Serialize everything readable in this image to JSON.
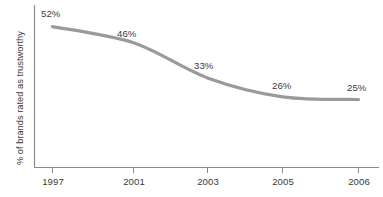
{
  "chart_data": {
    "type": "line",
    "title": "",
    "subtitle": "",
    "xlabel": "",
    "ylabel": "% of brands rated as trustworthy",
    "categories": [
      "1997",
      "2001",
      "2003",
      "2005",
      "2006"
    ],
    "values": [
      52,
      46,
      33,
      26,
      25
    ],
    "value_labels": [
      "52%",
      "46%",
      "33%",
      "26%",
      "25%"
    ],
    "series": [
      {
        "name": "% of brands rated as trustworthy",
        "values": [
          52,
          46,
          33,
          26,
          25
        ],
        "color": "#9a9a9a"
      }
    ],
    "ylim": [
      0,
      60
    ],
    "xlim": [
      "1997",
      "2006"
    ],
    "grid": false,
    "legend": false,
    "legend_position": "none",
    "axis_color": "#8c8c8c",
    "line_color": "#9a9a9a",
    "text_color": "#3a3a3a",
    "background": "#ffffff"
  },
  "axes": {
    "y_axis_title": "% of brands rated as trustworthy",
    "x_tick_labels": [
      "1997",
      "2001",
      "2003",
      "2005",
      "2006"
    ]
  },
  "labels": {
    "p1997": "52%",
    "p2001": "46%",
    "p2003": "33%",
    "p2005": "26%",
    "p2006": "25%"
  }
}
